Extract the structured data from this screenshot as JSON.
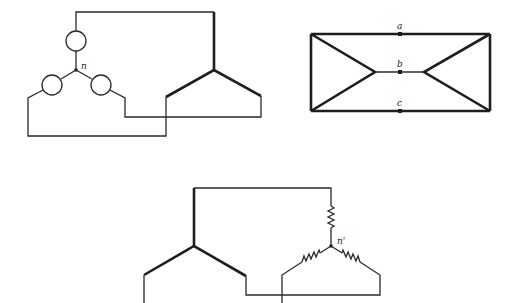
{
  "figure": {
    "diagrams": [
      {
        "id": "wye-source-to-delta",
        "description": "Y-connected source (three circular sources) with neutral n connected to a delta-connected winding",
        "labels": {
          "neutral": "n"
        }
      },
      {
        "id": "delta-delta-bowtie",
        "description": "Two delta-connected networks joined at nodes a, b, c",
        "labels": {
          "node_a": "a",
          "node_b": "b",
          "node_c": "c"
        }
      },
      {
        "id": "delta-to-wye-load",
        "description": "Delta-connected winding connected to a Y-connected resistive load with neutral n'",
        "labels": {
          "neutral": "n'"
        }
      }
    ],
    "colors": {
      "line": "#1e1e1e",
      "background": "#ffffff"
    }
  }
}
